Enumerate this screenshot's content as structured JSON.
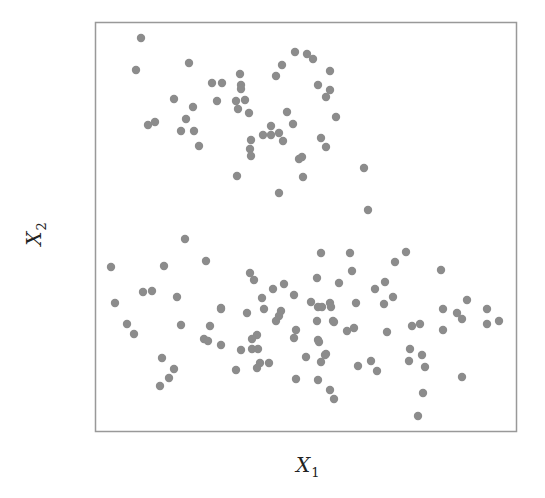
{
  "chart_data": {
    "type": "scatter",
    "title": "",
    "xlabel": "X",
    "xlabel_sub": "1",
    "ylabel": "X",
    "ylabel_sub": "2",
    "grid": false,
    "legend": null,
    "ticks": "none",
    "point_color": "#8c8c8c",
    "frame_color": "#999999",
    "plot_area_px": {
      "left": 95,
      "top": 22,
      "right": 516,
      "bottom": 431
    },
    "coordinate_note": "values are pixel positions within the 545x498 image (no axis ticks shown)",
    "series": [
      {
        "name": "cluster-top",
        "points": [
          [
            141,
            38
          ],
          [
            189,
            63
          ],
          [
            136,
            70
          ],
          [
            174,
            99
          ],
          [
            193,
            107
          ],
          [
            186,
            119
          ],
          [
            148,
            125
          ],
          [
            155,
            122
          ],
          [
            181,
            131
          ],
          [
            194,
            131
          ],
          [
            282,
            65
          ],
          [
            240,
            74
          ],
          [
            276,
            76
          ],
          [
            212,
            83
          ],
          [
            222,
            83
          ],
          [
            241,
            85
          ],
          [
            241,
            89
          ],
          [
            217,
            101
          ],
          [
            236,
            101
          ],
          [
            245,
            100
          ],
          [
            238,
            109
          ],
          [
            249,
            113
          ],
          [
            287,
            112
          ],
          [
            271,
            126
          ],
          [
            263,
            135
          ],
          [
            271,
            135
          ],
          [
            279,
            133
          ],
          [
            283,
            141
          ],
          [
            251,
            140
          ],
          [
            199,
            146
          ],
          [
            250,
            149
          ],
          [
            251,
            156
          ],
          [
            237,
            176
          ],
          [
            295,
            52
          ],
          [
            307,
            54
          ],
          [
            313,
            59
          ],
          [
            330,
            71
          ],
          [
            318,
            85
          ],
          [
            330,
            90
          ],
          [
            326,
            97
          ],
          [
            293,
            124
          ],
          [
            336,
            117
          ],
          [
            321,
            138
          ],
          [
            326,
            147
          ],
          [
            299,
            159
          ],
          [
            302,
            157
          ],
          [
            303,
            177
          ],
          [
            364,
            168
          ],
          [
            279,
            193
          ],
          [
            368,
            210
          ]
        ]
      },
      {
        "name": "cluster-bottom",
        "points": [
          [
            185,
            239
          ],
          [
            111,
            267
          ],
          [
            164,
            266
          ],
          [
            206,
            261
          ],
          [
            143,
            292
          ],
          [
            152,
            291
          ],
          [
            177,
            297
          ],
          [
            115,
            303
          ],
          [
            221,
            308
          ],
          [
            127,
            324
          ],
          [
            134,
            334
          ],
          [
            181,
            325
          ],
          [
            210,
            326
          ],
          [
            204,
            339
          ],
          [
            208,
            341
          ],
          [
            221,
            345
          ],
          [
            162,
            358
          ],
          [
            174,
            369
          ],
          [
            169,
            378
          ],
          [
            160,
            386
          ],
          [
            321,
            253
          ],
          [
            250,
            273
          ],
          [
            254,
            280
          ],
          [
            317,
            278
          ],
          [
            284,
            284
          ],
          [
            273,
            289
          ],
          [
            294,
            295
          ],
          [
            262,
            298
          ],
          [
            311,
            302
          ],
          [
            221,
            309
          ],
          [
            264,
            309
          ],
          [
            247,
            313
          ],
          [
            281,
            311
          ],
          [
            318,
            307
          ],
          [
            322,
            307
          ],
          [
            330,
            303
          ],
          [
            331,
            307
          ],
          [
            279,
            316
          ],
          [
            276,
            321
          ],
          [
            317,
            321
          ],
          [
            333,
            321
          ],
          [
            296,
            330
          ],
          [
            294,
            338
          ],
          [
            257,
            335
          ],
          [
            252,
            339
          ],
          [
            252,
            349
          ],
          [
            258,
            349
          ],
          [
            241,
            350
          ],
          [
            318,
            340
          ],
          [
            319,
            342
          ],
          [
            306,
            357
          ],
          [
            326,
            354
          ],
          [
            321,
            362
          ],
          [
            260,
            363
          ],
          [
            257,
            368
          ],
          [
            269,
            363
          ],
          [
            236,
            370
          ],
          [
            296,
            379
          ],
          [
            318,
            380
          ],
          [
            350,
            253
          ],
          [
            406,
            252
          ],
          [
            395,
            262
          ],
          [
            352,
            271
          ],
          [
            339,
            283
          ],
          [
            385,
            282
          ],
          [
            375,
            289
          ],
          [
            393,
            297
          ],
          [
            356,
            303
          ],
          [
            384,
            304
          ],
          [
            334,
            322
          ],
          [
            347,
            331
          ],
          [
            354,
            328
          ],
          [
            387,
            332
          ],
          [
            325,
            355
          ],
          [
            358,
            366
          ],
          [
            371,
            361
          ],
          [
            377,
            371
          ],
          [
            330,
            390
          ],
          [
            334,
            399
          ],
          [
            441,
            270
          ],
          [
            467,
            300
          ],
          [
            443,
            309
          ],
          [
            487,
            309
          ],
          [
            457,
            313
          ],
          [
            462,
            319
          ],
          [
            499,
            321
          ],
          [
            487,
            324
          ],
          [
            412,
            326
          ],
          [
            420,
            324
          ],
          [
            443,
            330
          ],
          [
            410,
            349
          ],
          [
            422,
            355
          ],
          [
            409,
            361
          ],
          [
            425,
            367
          ],
          [
            462,
            377
          ],
          [
            423,
            393
          ],
          [
            418,
            416
          ]
        ]
      }
    ]
  }
}
